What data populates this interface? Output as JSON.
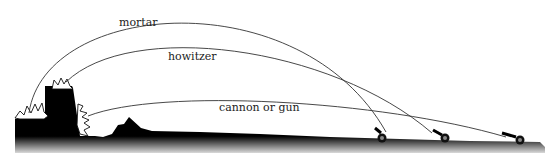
{
  "diagram": {
    "type": "artillery-trajectory-comparison",
    "labels": {
      "mortar": "mortar",
      "howitzer": "howitzer",
      "cannon": "cannon or gun"
    },
    "trajectories": [
      {
        "name": "mortar",
        "label": "mortar",
        "from": "left gun",
        "to": "outer wall top-left",
        "arc": "high"
      },
      {
        "name": "howitzer",
        "label": "howitzer",
        "from": "middle gun",
        "to": "tower top",
        "arc": "medium"
      },
      {
        "name": "cannon",
        "label": "cannon or gun",
        "from": "right gun",
        "to": "tower side",
        "arc": "flat"
      }
    ],
    "colors": {
      "ink": "#000000",
      "line": "#333333",
      "background": "#ffffff"
    }
  }
}
